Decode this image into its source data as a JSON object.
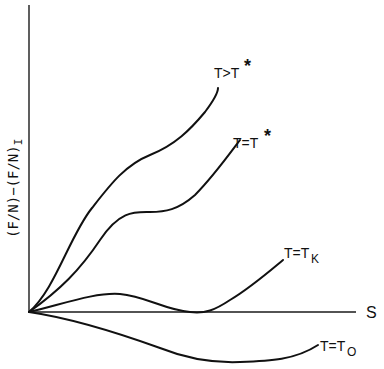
{
  "diagram": {
    "y_axis_label": "(F/N)−(F/N)",
    "y_axis_label_subscript": "I",
    "x_axis_label": "S",
    "curves": [
      {
        "id": "t-gt-tstar",
        "label_main": "T>T",
        "label_sup": "*",
        "label_sub": ""
      },
      {
        "id": "t-eq-tstar",
        "label_main": "T=T",
        "label_sup": "*",
        "label_sub": ""
      },
      {
        "id": "t-eq-tk",
        "label_main": "T=T",
        "label_sup": "",
        "label_sub": "K"
      },
      {
        "id": "t-eq-t0",
        "label_main": "T=T",
        "label_sup": "",
        "label_sub": "O"
      }
    ],
    "colors": {
      "ink": "#111111",
      "background": "#ffffff"
    }
  }
}
